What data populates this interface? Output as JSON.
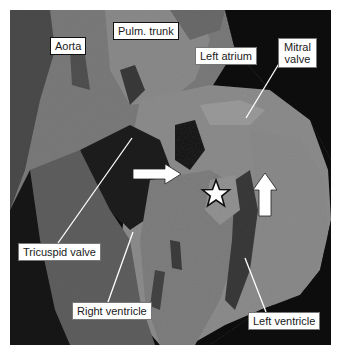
{
  "figure": {
    "labels": {
      "aorta": "Aorta",
      "pulm_trunk": "Pulm. trunk",
      "left_atrium": "Left atrium",
      "mitral_valve_line1": "Mitral",
      "mitral_valve_line2": "valve",
      "tricuspid_valve": "Tricuspid valve",
      "right_ventricle": "Right ventricle",
      "left_ventricle": "Left ventricle"
    },
    "markers": {
      "star": "star-marker",
      "horizontal_arrow": "right-arrow",
      "vertical_arrow": "up-arrow"
    },
    "colors": {
      "background": "#0d0d0d",
      "tissue_light": "#8f8f8f",
      "tissue_mid": "#6e6e6e",
      "tissue_dark": "#3e3e3e",
      "label_bg": "#ffffff",
      "arrow_fill": "#ffffff"
    }
  }
}
